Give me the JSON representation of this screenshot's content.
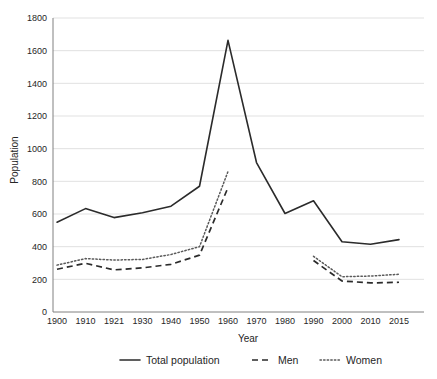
{
  "chart_data": {
    "type": "line",
    "title": "",
    "xlabel": "Year",
    "ylabel": "Population",
    "categories": [
      "1900",
      "1910",
      "1921",
      "1930",
      "1940",
      "1950",
      "1960",
      "1970",
      "1980",
      "1990",
      "2000",
      "2010",
      "2015"
    ],
    "ylim": [
      0,
      1800
    ],
    "yticks": [
      0,
      200,
      400,
      600,
      800,
      1000,
      1200,
      1400,
      1600,
      1800
    ],
    "ytick_labels": [
      "0",
      "200",
      "400",
      "600",
      "800",
      "1000",
      "1200",
      "1400",
      "1600",
      "1800"
    ],
    "grid": true,
    "legend_position": "bottom",
    "series": [
      {
        "name": "Total population",
        "style": "solid",
        "color": "#2b2b2b",
        "values": [
          550,
          633,
          578,
          608,
          648,
          770,
          1663,
          915,
          603,
          681,
          430,
          415,
          443
        ]
      },
      {
        "name": "Men",
        "style": "dashed",
        "color": "#2b2b2b",
        "values": [
          262,
          298,
          258,
          270,
          292,
          348,
          762,
          null,
          null,
          315,
          190,
          178,
          182
        ]
      },
      {
        "name": "Women",
        "style": "dotted",
        "color": "#5a5a5a",
        "values": [
          287,
          327,
          318,
          322,
          352,
          400,
          860,
          null,
          null,
          341,
          216,
          220,
          231
        ]
      }
    ]
  },
  "legend": {
    "items": [
      {
        "label": "Total population",
        "style": "solid"
      },
      {
        "label": "Men",
        "style": "dashed"
      },
      {
        "label": "Women",
        "style": "dotted"
      }
    ]
  },
  "axes": {
    "x_title": "Year",
    "y_title": "Population"
  }
}
